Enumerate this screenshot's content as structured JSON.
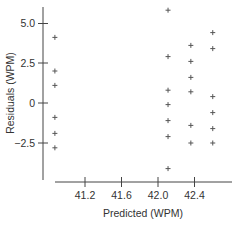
{
  "chart_data": {
    "type": "scatter",
    "title": "",
    "xlabel": "Predicted (WPM)",
    "ylabel": "Residuals (WPM)",
    "x_ticks": [
      41.2,
      41.6,
      42.0,
      42.4
    ],
    "x_tick_labels": [
      "41.2",
      "41.6",
      "42.0",
      "42.4"
    ],
    "y_ticks": [
      -2.5,
      0,
      2.5,
      5.0
    ],
    "y_tick_labels": [
      "−2.5",
      "0",
      "2.5",
      "5.0"
    ],
    "xlim": [
      40.5,
      43.0
    ],
    "ylim": [
      -4.8,
      6.0
    ],
    "grid": false,
    "legend": null,
    "marker": "plus",
    "marker_color": "#555555",
    "axis_color": "#444444",
    "series": [
      {
        "name": "residuals",
        "points": [
          {
            "x": 40.87,
            "y": 4.1
          },
          {
            "x": 40.87,
            "y": 2.0
          },
          {
            "x": 40.87,
            "y": 1.1
          },
          {
            "x": 40.87,
            "y": -0.9
          },
          {
            "x": 40.87,
            "y": -1.9
          },
          {
            "x": 40.87,
            "y": -2.8
          },
          {
            "x": 42.11,
            "y": 5.8
          },
          {
            "x": 42.11,
            "y": 2.9
          },
          {
            "x": 42.11,
            "y": 0.8
          },
          {
            "x": 42.11,
            "y": -0.1
          },
          {
            "x": 42.11,
            "y": -1.1
          },
          {
            "x": 42.11,
            "y": -2.1
          },
          {
            "x": 42.11,
            "y": -4.1
          },
          {
            "x": 42.36,
            "y": 3.6
          },
          {
            "x": 42.36,
            "y": 2.6
          },
          {
            "x": 42.36,
            "y": 1.6
          },
          {
            "x": 42.36,
            "y": 0.7
          },
          {
            "x": 42.36,
            "y": -1.4
          },
          {
            "x": 42.36,
            "y": -2.5
          },
          {
            "x": 42.6,
            "y": 4.4
          },
          {
            "x": 42.6,
            "y": 3.4
          },
          {
            "x": 42.6,
            "y": 0.4
          },
          {
            "x": 42.6,
            "y": -0.6
          },
          {
            "x": 42.6,
            "y": -1.6
          },
          {
            "x": 42.6,
            "y": -2.5
          }
        ]
      }
    ]
  }
}
